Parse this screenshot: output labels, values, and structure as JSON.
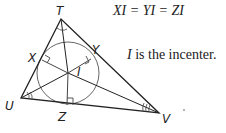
{
  "diagram": {
    "type": "geometry",
    "colors": {
      "stroke": "#222222",
      "circle": "#555555",
      "background": "#ffffff"
    },
    "vertices": {
      "T": {
        "label": "T",
        "x": 61,
        "y": 19
      },
      "U": {
        "label": "U",
        "x": 21,
        "y": 98
      },
      "V": {
        "label": "V",
        "x": 159,
        "y": 113
      }
    },
    "incenter": {
      "label": "I",
      "x": 68,
      "y": 73
    },
    "tangent_points": {
      "X": {
        "label": "X",
        "x": 42,
        "y": 60
      },
      "Y": {
        "label": "Y",
        "x": 91,
        "y": 59
      },
      "Z": {
        "label": "Z",
        "x": 67,
        "y": 105
      }
    },
    "incircle": {
      "cx": 68,
      "cy": 73,
      "r": 31
    }
  },
  "annotations": {
    "equation": "XI = YI = ZI",
    "note_var": "I",
    "note_rest": " is the incenter."
  }
}
